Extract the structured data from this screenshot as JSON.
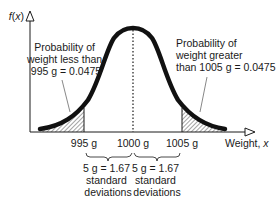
{
  "diagram": {
    "type": "normal-distribution",
    "y_axis": {
      "label_func": "f",
      "label_var": "x"
    },
    "x_axis": {
      "label": "Weight, ",
      "label_var": "x"
    },
    "ticks": [
      {
        "label": "995 g",
        "value": 995
      },
      {
        "label": "1000 g",
        "value": 1000
      },
      {
        "label": "1005 g",
        "value": 1005
      }
    ],
    "annotations": {
      "left": [
        "Probability of",
        "weight less than",
        "995 g = 0.0475"
      ],
      "right": [
        "Probability of",
        "weight greater",
        "than 1005 g = 0.0475"
      ]
    },
    "braces": [
      {
        "lines": [
          "5 g = 1.67",
          "standard",
          "deviations"
        ]
      },
      {
        "lines": [
          "5 g = 1.67",
          "standard",
          "deviations"
        ]
      }
    ],
    "mean": 1000,
    "tail_probability": 0.0475,
    "colors": {
      "ink": "#1a1a1a",
      "background": "#ffffff"
    }
  }
}
